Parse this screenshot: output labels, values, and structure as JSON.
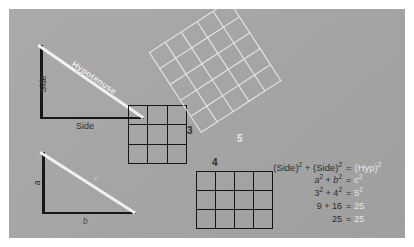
{
  "diagram": {
    "background_color": "#a6a6a6",
    "frame_color": "#ffffff",
    "dark_ink": "#111111",
    "light_ink": "#f2f2f2"
  },
  "triangle_labels": {
    "side_vertical": "Side",
    "side_horizontal": "Side",
    "hypotenuse": "Hypotenuse",
    "leg_a": "a",
    "leg_b": "b",
    "leg_c": "c"
  },
  "squares": [
    {
      "name": "square-a",
      "label": "3",
      "rows": 3,
      "cols": 3,
      "area": 9,
      "color": "#111111",
      "orientation": "upright"
    },
    {
      "name": "square-b",
      "label": "4",
      "rows": 3,
      "cols": 4,
      "area": 16,
      "color": "#111111",
      "orientation": "upright"
    },
    {
      "name": "square-c",
      "label": "5",
      "rows": 5,
      "cols": 5,
      "area": 25,
      "color": "#f0f0f0",
      "orientation": "tilted"
    }
  ],
  "equations": [
    {
      "left_a": "(Side)",
      "left_a_sup": "2",
      "op": "+",
      "left_b": "(Side)",
      "left_b_sup": "2",
      "eq": "=",
      "right": "(Hyp)",
      "right_sup": "2"
    },
    {
      "left_a": "a",
      "left_a_sup": "2",
      "op": "+",
      "left_b": "b",
      "left_b_sup": "2",
      "eq": "=",
      "right": "c",
      "right_sup": "2"
    },
    {
      "left_a": "3",
      "left_a_sup": "2",
      "op": "+",
      "left_b": "4",
      "left_b_sup": "2",
      "eq": "=",
      "right": "5",
      "right_sup": "2"
    },
    {
      "left_a": "9",
      "left_a_sup": "",
      "op": "+",
      "left_b": "16",
      "left_b_sup": "",
      "eq": "=",
      "right": "25",
      "right_sup": ""
    },
    {
      "left_a": "",
      "left_a_sup": "",
      "op": "",
      "left_b": "25",
      "left_b_sup": "",
      "eq": "=",
      "right": "25",
      "right_sup": ""
    }
  ],
  "eq_rows": {
    "r0": {
      "l": "(Side)",
      "l2": "2",
      "op": "+",
      "m": "(Side)",
      "m2": "2",
      "eq": "=",
      "r": "(Hyp)",
      "r2": "2"
    },
    "r1": {
      "l": "a",
      "l2": "2",
      "op": "+",
      "m": "b",
      "m2": "2",
      "eq": "=",
      "r": "c",
      "r2": "2"
    },
    "r2": {
      "l": "3",
      "l2": "2",
      "op": "+",
      "m": "4",
      "m2": "2",
      "eq": "=",
      "r": "5",
      "r2": "2"
    },
    "r3": {
      "l": "9",
      "l2": "",
      "op": "+",
      "m": "16",
      "m2": "",
      "eq": "=",
      "r": "25",
      "r2": ""
    },
    "r4": {
      "l": "",
      "l2": "",
      "op": "",
      "m": "25",
      "m2": "",
      "eq": "=",
      "r": "25",
      "r2": ""
    }
  }
}
